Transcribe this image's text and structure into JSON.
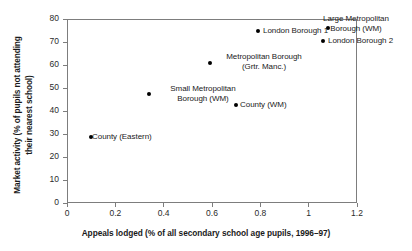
{
  "chart_data": {
    "type": "scatter",
    "title": "",
    "xlabel": "Appeals lodged (% of all secondary school age pupils, 1996–97)",
    "ylabel_line1": "Market activity (% of pupils not attending",
    "ylabel_line2": "their nearest school)",
    "xlim": [
      0,
      1.2
    ],
    "ylim": [
      0,
      80
    ],
    "xticks": [
      "0",
      "0.2",
      "0.4",
      "0.6",
      "0.8",
      "1",
      "1.2"
    ],
    "xtick_values": [
      0,
      0.2,
      0.4,
      0.6,
      0.8,
      1.0,
      1.2
    ],
    "yticks": [
      "0",
      "10",
      "20",
      "30",
      "40",
      "50",
      "60",
      "70",
      "80"
    ],
    "ytick_values": [
      0,
      10,
      20,
      30,
      40,
      50,
      60,
      70,
      80
    ],
    "grid": false,
    "legend": "none",
    "marker_color": "#000000",
    "axis_color": "#7d7d7d",
    "points": [
      {
        "label_line1": "County (Eastern)",
        "label_line2": "",
        "x": 0.1,
        "y": 28.7,
        "label_align": "left"
      },
      {
        "label_line1": "Small Metropolitan",
        "label_line2": "Borough (WM)",
        "x": 0.34,
        "y": 47.4,
        "label_align": "center"
      },
      {
        "label_line1": "Metropolitan Borough",
        "label_line2": "(Grtr. Manc.)",
        "x": 0.59,
        "y": 60.9,
        "label_align": "center"
      },
      {
        "label_line1": "County (WM)",
        "label_line2": "",
        "x": 0.7,
        "y": 42.6,
        "label_align": "left"
      },
      {
        "label_line1": "London Borough 1",
        "label_line2": "",
        "x": 0.79,
        "y": 74.8,
        "label_align": "left"
      },
      {
        "label_line1": "Large Metropolitan",
        "label_line2": "Borough (WM)",
        "x": 1.08,
        "y": 76.1,
        "label_align": "center"
      },
      {
        "label_line1": "London Borough 2",
        "label_line2": "",
        "x": 1.06,
        "y": 70.4,
        "label_align": "left"
      }
    ]
  },
  "label_positions": [
    {
      "left": 92,
      "top": 132,
      "width": 90,
      "align": "align-left"
    },
    {
      "left": 153,
      "top": 84,
      "width": 100,
      "align": "align-center"
    },
    {
      "left": 214,
      "top": 52,
      "width": 100,
      "align": "align-center"
    },
    {
      "left": 240,
      "top": 100,
      "width": 80,
      "align": "align-left"
    },
    {
      "left": 263,
      "top": 26,
      "width": 90,
      "align": "align-left"
    },
    {
      "left": 306,
      "top": 14,
      "width": 100,
      "align": "align-center"
    },
    {
      "left": 328,
      "top": 36,
      "width": 90,
      "align": "align-left"
    }
  ]
}
